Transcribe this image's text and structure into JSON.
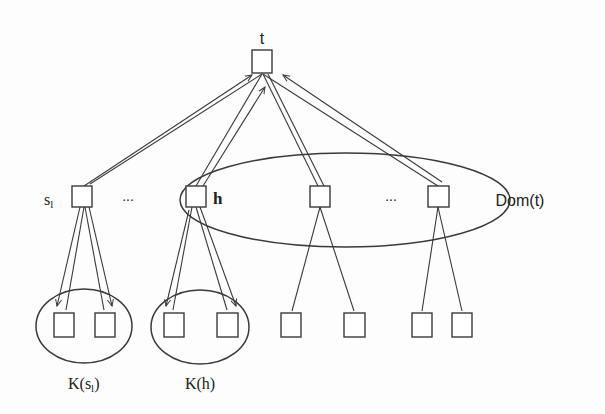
{
  "diagram": {
    "root": {
      "label": "t"
    },
    "middle": [
      {
        "label_main": "s",
        "label_sub": "l"
      },
      {
        "label": "h"
      },
      {
        "label": ""
      },
      {
        "label": ""
      }
    ],
    "ellipsis_left": "...",
    "ellipsis_right": "...",
    "dom_label": "Dom(t)",
    "groups": [
      {
        "label_prefix": "K(s",
        "label_sub": "l",
        "label_suffix": ")"
      },
      {
        "label": "K(h)"
      }
    ],
    "colors": {
      "stroke": "#3a3a3a",
      "background": "#fdfdfd"
    }
  }
}
